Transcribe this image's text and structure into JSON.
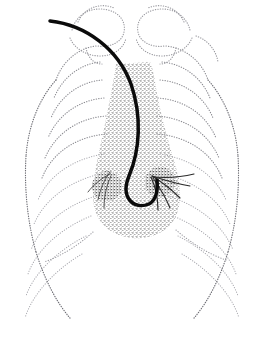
{
  "figure": {
    "modality": "stippled line illustration",
    "background_color": "#ffffff",
    "width": 262,
    "height": 348
  },
  "colors": {
    "rib_dot": "#8d8d93",
    "rib_dot_faint": "#a9a9af",
    "rib_dot_dark": "#6f6f76",
    "clavicle_dot": "#9a9aa0",
    "stipple": "#4a4a4a",
    "vessel": "#2b2b2b",
    "catheter": "#0b0b0b",
    "diaphragm": "#9d9da3"
  },
  "structures": {
    "catheter": {
      "name": "catheter",
      "path": "M 50 21 C 86 25, 118 49, 131 84 C 142 116, 140 150, 129 176 C 120 198, 134 210, 149 204 C 156 200, 158 191, 157 180",
      "stroke_width": 3.5,
      "entry_point": [
        50,
        21
      ],
      "tip_point": [
        157,
        180
      ]
    },
    "mediastinum": {
      "name": "mediastinum-heart-silhouette",
      "path": "M 116 64 C 114 78, 110 100, 105 124 C 100 148, 94 170, 93 192 C 92 214, 102 230, 122 236 C 142 242, 164 236, 174 220 C 183 205, 181 185, 175 164 C 168 140, 160 112, 156 88 C 154 74, 152 66, 150 62 Z",
      "top_y": 62,
      "bottom_y": 238
    },
    "left_hilum": {
      "name": "left-hilum",
      "center": [
        107,
        186
      ]
    },
    "right_hilum": {
      "name": "right-hilum",
      "center": [
        160,
        182
      ]
    }
  },
  "ribs": {
    "left_upper": [
      "M 96 46 C 78 48, 62 62, 56 80",
      "M 100 62 C 80 64, 62 78, 54 98",
      "M 102 80 C 80 82, 60 96, 51 118",
      "M 104 98 C 80 100, 58 114, 48 138",
      "M 106 116 C 80 118, 56 132, 45 158",
      "M 107 134 C 80 136, 53 150, 42 178"
    ],
    "left_lower": [
      "M 104 154 C 78 158, 50 172, 38 200",
      "M 100 174 C 74 180, 46 196, 34 224",
      "M 96 196 C 70 204, 42 222, 31 250",
      "M 91 216 C 66 226, 38 246, 28 274",
      "M 86 236 C 62 248, 35 270, 26 296",
      "M 82 254 C 58 268, 33 292, 25 318"
    ],
    "left_outer": [
      "M 56 80 C 38 100, 28 128, 26 156",
      "M 26 156 C 24 190, 28 224, 36 252",
      "M 36 252 C 44 278, 56 302, 70 318"
    ],
    "right_upper": [
      "M 166 46 C 186 48, 202 62, 208 80",
      "M 162 62 C 184 64, 202 78, 210 98",
      "M 160 80 C 184 82, 204 96, 213 118",
      "M 158 98 C 184 100, 206 114, 216 138",
      "M 157 116 C 184 118, 208 132, 219 158",
      "M 157 134 C 184 136, 211 150, 222 178"
    ],
    "right_lower": [
      "M 160 154 C 186 158, 214 172, 226 200",
      "M 164 174 C 190 180, 218 196, 230 224",
      "M 168 196 C 194 204, 222 222, 233 250",
      "M 173 216 C 198 226, 226 246, 236 274",
      "M 178 236 C 202 248, 229 270, 238 296",
      "M 182 254 C 206 268, 231 292, 239 318"
    ],
    "right_outer": [
      "M 208 80 C 226 100, 236 128, 238 156",
      "M 238 156 C 240 190, 236 224, 228 252",
      "M 228 252 C 220 278, 208 302, 194 318"
    ]
  },
  "clavicles": {
    "left": [
      "M 72 30 C 76 14, 92 6, 108 10 C 120 13, 126 22, 124 32 C 122 42, 110 48, 98 46",
      "M 78 22 C 84 8, 100 2, 114 8",
      "M 70 38 C 74 48, 86 56, 100 56 C 114 56, 124 48, 126 38",
      "M 86 48 C 88 58, 94 64, 102 64"
    ],
    "right": [
      "M 190 30 C 186 14, 170 6, 154 10 C 142 13, 136 22, 138 32 C 140 42, 152 48, 164 46",
      "M 184 22 C 178 8, 162 2, 148 8",
      "M 192 38 C 188 48, 176 56, 162 56 C 148 56, 138 48, 136 38",
      "M 176 48 C 174 58, 168 64, 160 64",
      "M 196 36 C 208 40, 216 50, 218 62"
    ]
  },
  "diaphragm": {
    "left": "M 93 232 C 80 244, 62 256, 44 262",
    "right": "M 176 230 C 190 242, 208 254, 226 260"
  },
  "vessels": {
    "right_hilum": [
      "M 152 176 C 162 182, 172 190, 180 198",
      "M 152 176 C 164 180, 178 184, 190 186",
      "M 153 178 C 160 188, 166 198, 170 208",
      "M 154 177 C 168 178, 182 177, 194 174",
      "M 151 177 C 156 188, 158 200, 158 210"
    ],
    "left_hilum": [
      "M 110 172 C 104 180, 100 190, 98 200",
      "M 110 174 C 102 178, 94 184, 88 192",
      "M 111 176 C 106 186, 104 198, 104 208"
    ]
  }
}
